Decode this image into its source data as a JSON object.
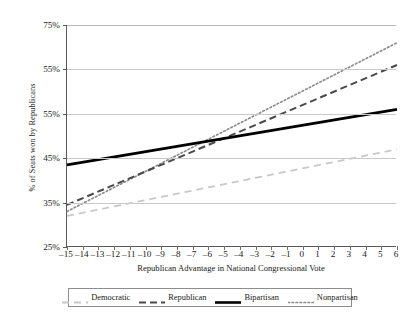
{
  "chart_data": {
    "type": "line",
    "title": "",
    "xlabel": "Republican Advantage in National Congressional Vote",
    "ylabel": "% of Seats won by Republicans",
    "xlim": [
      -15,
      6
    ],
    "ylim": [
      25,
      75
    ],
    "grid": true,
    "legend_position": "bottom",
    "x_ticks": [
      "-15",
      "-14",
      "-13",
      "-12",
      "-11",
      "-10",
      "-9",
      "-8",
      "-7",
      "-6",
      "-5",
      "-4",
      "-3",
      "-2",
      "-1",
      "0",
      "1",
      "2",
      "3",
      "4",
      "5",
      "6"
    ],
    "y_ticks": [
      "75%",
      "55%",
      "55%",
      "45%",
      "35%",
      "25%"
    ],
    "y_tick_values": [
      75,
      65,
      55,
      45,
      35,
      25
    ],
    "x": [
      -15,
      6
    ],
    "series": [
      {
        "name": "Democratic",
        "style": "dashed-light",
        "color": "#c8c8c8",
        "values": [
          32.0,
          47.0
        ]
      },
      {
        "name": "Republican",
        "style": "dashed-dark",
        "color": "#4a4a4a",
        "values": [
          34.5,
          66.0
        ]
      },
      {
        "name": "Bipartisan",
        "style": "solid-thick",
        "color": "#000000",
        "values": [
          43.5,
          56.0
        ]
      },
      {
        "name": "Nonpartisan",
        "style": "dotted",
        "color": "#8c8c8c",
        "values": [
          33.0,
          71.0
        ]
      }
    ]
  },
  "colors": {
    "axis": "#5a5a5a",
    "gridline": "#c9c9c9",
    "background": "#ffffff",
    "text": "#1a1a1a",
    "legend_border": "#8d8d8d"
  }
}
